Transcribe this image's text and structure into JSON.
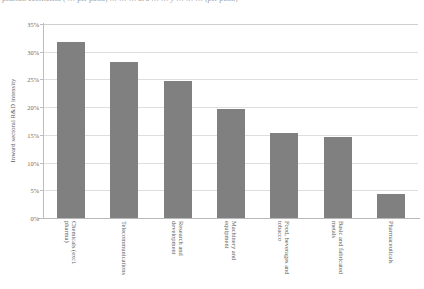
{
  "figure": {
    "cropped_caption_fragment": "pearson coefficient ( … per point) … … … at a … … y … … … (per point)"
  },
  "chart_data": {
    "type": "bar",
    "title": "",
    "xlabel": "",
    "ylabel": "Inward sectoral R&D intensity",
    "ylim": [
      0,
      35
    ],
    "ytick_labels": [
      "35%",
      "30%",
      "25%",
      "20%",
      "15%",
      "10%",
      "5%",
      "0%"
    ],
    "ytick_values": [
      35,
      30,
      25,
      20,
      15,
      10,
      5,
      0
    ],
    "grid": true,
    "legend": null,
    "bar_color": "#808080",
    "categories": [
      "Chemicals (excl. pharma)",
      "Telecommunications",
      "Research and development",
      "Machinery and equipment",
      "Food, beverages and tobacco",
      "Basic and fabricated metals",
      "Pharmaceuticals"
    ],
    "category_lines": [
      [
        "Chemicals (excl.",
        "pharma)"
      ],
      [
        "Telecommunications",
        ""
      ],
      [
        "Research and",
        "development"
      ],
      [
        "Machinery and",
        "equipment"
      ],
      [
        "Food, beverages and",
        "tobacco"
      ],
      [
        "Basic and fabricated",
        "metals"
      ],
      [
        "Pharmaceuticals",
        ""
      ]
    ],
    "values": [
      31.7,
      28.2,
      24.7,
      19.6,
      15.4,
      14.6,
      4.4
    ]
  }
}
